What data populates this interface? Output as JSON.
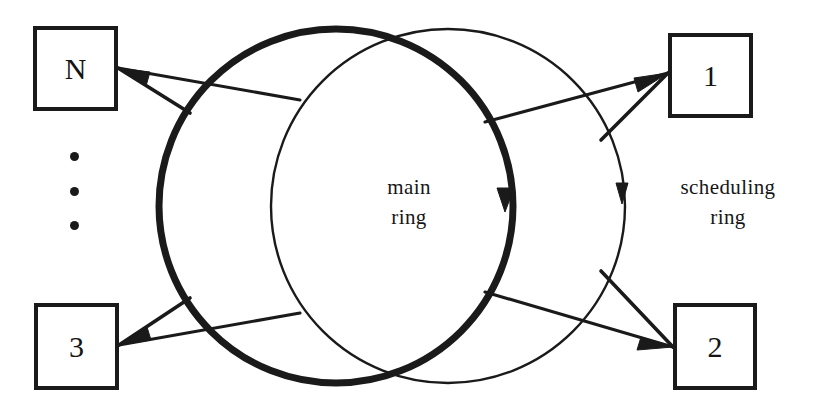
{
  "figure": {
    "width": 831,
    "height": 414,
    "background": "#ffffff",
    "ink_color": "#1a1a1a"
  },
  "labels": {
    "main_ring": "main\nring",
    "scheduling_ring": "scheduling\nring"
  },
  "nodes": [
    {
      "id": "node-n",
      "label": "N",
      "x": 33,
      "y": 26,
      "w": 85,
      "h": 85
    },
    {
      "id": "node-1",
      "label": "1",
      "x": 668,
      "y": 33,
      "w": 85,
      "h": 85
    },
    {
      "id": "node-3",
      "label": "3",
      "x": 34,
      "y": 303,
      "w": 85,
      "h": 87
    },
    {
      "id": "node-2",
      "label": "2",
      "x": 673,
      "y": 303,
      "w": 84,
      "h": 87
    }
  ],
  "ellipsis_dots": [
    {
      "x": 70,
      "y": 152
    },
    {
      "x": 70,
      "y": 187
    },
    {
      "x": 70,
      "y": 221
    }
  ],
  "rings": [
    {
      "id": "main-ring",
      "name": "main ring",
      "style": "thick",
      "cx": 336,
      "cy": 206,
      "r": 177,
      "stroke_width": 7,
      "direction": "clockwise",
      "arrow_at": {
        "x": 506,
        "y": 196
      }
    },
    {
      "id": "scheduling-ring",
      "name": "scheduling ring",
      "style": "thin",
      "cx": 448,
      "cy": 206,
      "r": 177,
      "stroke_width": 2.4,
      "direction": "clockwise",
      "arrow_at": {
        "x": 621,
        "y": 190
      }
    }
  ],
  "connections": [
    {
      "id": "conn-n-in",
      "from": "scheduling-ring",
      "to": "node-n",
      "arrow": "into-node"
    },
    {
      "id": "conn-n-out",
      "from": "node-n",
      "to": "main-ring",
      "arrow": "none"
    },
    {
      "id": "conn-1-in",
      "from": "main-ring",
      "to": "node-1",
      "arrow": "into-node"
    },
    {
      "id": "conn-1-out",
      "from": "node-1",
      "to": "scheduling-ring",
      "arrow": "none"
    },
    {
      "id": "conn-3-in",
      "from": "scheduling-ring",
      "to": "node-3",
      "arrow": "into-node"
    },
    {
      "id": "conn-3-out",
      "from": "node-3",
      "to": "main-ring",
      "arrow": "none"
    },
    {
      "id": "conn-2-in",
      "from": "main-ring",
      "to": "node-2",
      "arrow": "into-node"
    },
    {
      "id": "conn-2-out",
      "from": "node-2",
      "to": "scheduling-ring",
      "arrow": "none"
    }
  ]
}
